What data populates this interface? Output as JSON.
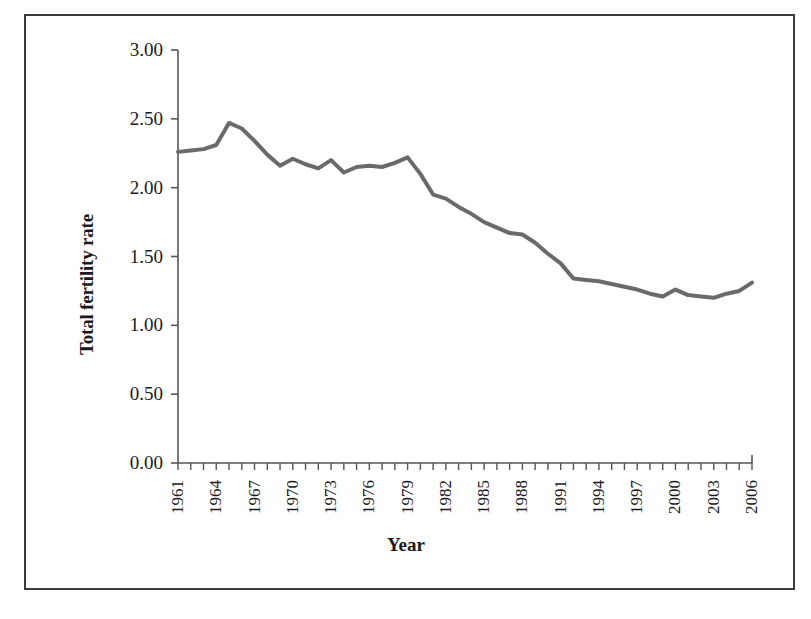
{
  "chart_data": {
    "type": "line",
    "title": "",
    "xlabel": "Year",
    "ylabel": "Total fertility rate",
    "xlim": [
      1961,
      2006
    ],
    "ylim": [
      0.0,
      3.0
    ],
    "ytick_step": 0.5,
    "xtick_step": 1,
    "xtick_label_step": 3,
    "grid": false,
    "legend": false,
    "line_color": "#6a6a6a",
    "line_width": 4,
    "ytick_labels": [
      "0.00",
      "0.50",
      "1.00",
      "1.50",
      "2.00",
      "2.50",
      "3.00"
    ],
    "ytick_values": [
      0.0,
      0.5,
      1.0,
      1.5,
      2.0,
      2.5,
      3.0
    ],
    "xtick_labels": [
      "1961",
      "1964",
      "1967",
      "1970",
      "1973",
      "1976",
      "1979",
      "1982",
      "1985",
      "1988",
      "1991",
      "1994",
      "1997",
      "2000",
      "2003",
      "2006"
    ],
    "xtick_values": [
      1961,
      1964,
      1967,
      1970,
      1973,
      1976,
      1979,
      1982,
      1985,
      1988,
      1991,
      1994,
      1997,
      2000,
      2003,
      2006
    ],
    "x": [
      1961,
      1962,
      1963,
      1964,
      1965,
      1966,
      1967,
      1968,
      1969,
      1970,
      1971,
      1972,
      1973,
      1974,
      1975,
      1976,
      1977,
      1978,
      1979,
      1980,
      1981,
      1982,
      1983,
      1984,
      1985,
      1986,
      1987,
      1988,
      1989,
      1990,
      1991,
      1992,
      1993,
      1994,
      1995,
      1996,
      1997,
      1998,
      1999,
      2000,
      2001,
      2002,
      2003,
      2004,
      2005,
      2006
    ],
    "values": [
      2.26,
      2.27,
      2.28,
      2.31,
      2.47,
      2.43,
      2.34,
      2.24,
      2.16,
      2.21,
      2.17,
      2.14,
      2.2,
      2.11,
      2.15,
      2.16,
      2.15,
      2.18,
      2.22,
      2.1,
      1.95,
      1.92,
      1.86,
      1.81,
      1.75,
      1.71,
      1.67,
      1.66,
      1.6,
      1.52,
      1.45,
      1.34,
      1.33,
      1.32,
      1.3,
      1.28,
      1.26,
      1.23,
      1.21,
      1.26,
      1.22,
      1.21,
      1.2,
      1.23,
      1.25,
      1.31
    ],
    "series_name": "Total fertility rate"
  },
  "axes": {
    "y_title": "Total fertility rate",
    "x_title": "Year"
  }
}
